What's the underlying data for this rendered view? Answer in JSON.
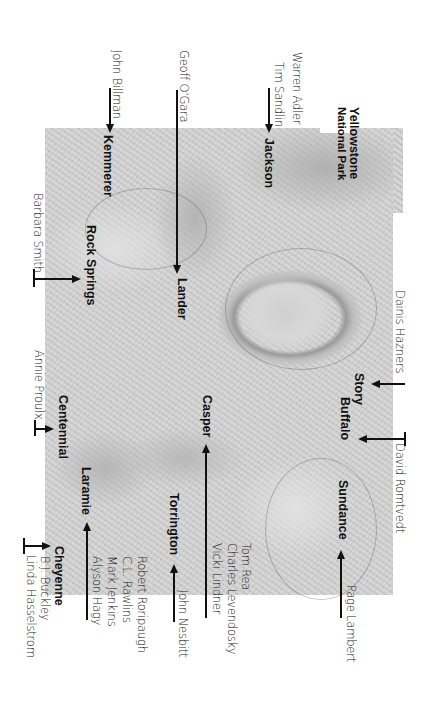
{
  "map": {
    "region": "Wyoming shaded relief map",
    "orientation": "rotated 90 degrees clockwise",
    "background_color": "#d3d3d3",
    "ink_color": "#111111"
  },
  "places": {
    "yellowstone_1": "Yellowstone",
    "yellowstone_2": "National Park",
    "jackson": "Jackson",
    "kemmerer": "Kemmerer",
    "rock_springs": "Rock Springs",
    "lander": "Lander",
    "centennial": "Centennial",
    "casper": "Casper",
    "laramie": "Laramie",
    "torrington": "Torrington",
    "cheyenne": "Cheyenne",
    "story": "Story",
    "buffalo": "Buffalo",
    "sundance": "Sundance"
  },
  "authors": {
    "john_billman": "John Billman",
    "geoff_ogara": "Geoff O'Gara",
    "warren_adler": "Warren Adler",
    "tim_sandlin": "Tim Sandlin",
    "barbara_smith": "Barbara Smith",
    "annie_proulx": "Annie Proulx",
    "bj_buckley": "B.J. Buckley",
    "linda_hasselstrom": "Linda Hasselstrom",
    "robert_roripaugh": "Robert Roripaugh",
    "cl_rawlins": "C.L. Rawlins",
    "mark_jenkins": "Mark Jenkins",
    "alyson_hagy": "Alyson Hagy",
    "john_nesbitt": "John Nesbitt",
    "tom_rea": "Tom Rea",
    "charles_levendosky": "Charles Levendosky",
    "vicki_lindner": "Vicki Lindner",
    "page_lambert": "Page Lambert",
    "dainis_hazners": "Dainis Hazners",
    "david_romtvedt": "David Romtvedt"
  },
  "links": [
    {
      "author": "John Billman",
      "place": "Kemmerer"
    },
    {
      "author": "Geoff O'Gara",
      "place": "Lander"
    },
    {
      "author": "Warren Adler",
      "place": "Jackson"
    },
    {
      "author": "Tim Sandlin",
      "place": "Jackson"
    },
    {
      "author": "Barbara Smith",
      "place": "Rock Springs"
    },
    {
      "author": "Annie Proulx",
      "place": "Centennial"
    },
    {
      "author": "B.J. Buckley",
      "place": "Cheyenne"
    },
    {
      "author": "Linda Hasselstrom",
      "place": "Cheyenne"
    },
    {
      "author": "Robert Roripaugh",
      "place": "Laramie"
    },
    {
      "author": "C.L. Rawlins",
      "place": "Laramie"
    },
    {
      "author": "Mark Jenkins",
      "place": "Laramie"
    },
    {
      "author": "Alyson Hagy",
      "place": "Laramie"
    },
    {
      "author": "John Nesbitt",
      "place": "Torrington"
    },
    {
      "author": "Tom Rea",
      "place": "Casper"
    },
    {
      "author": "Charles Levendosky",
      "place": "Casper"
    },
    {
      "author": "Vicki Lindner",
      "place": "Casper"
    },
    {
      "author": "Page Lambert",
      "place": "Sundance"
    },
    {
      "author": "Dainis Hazners",
      "place": "Story"
    },
    {
      "author": "David Romtvedt",
      "place": "Buffalo"
    }
  ]
}
